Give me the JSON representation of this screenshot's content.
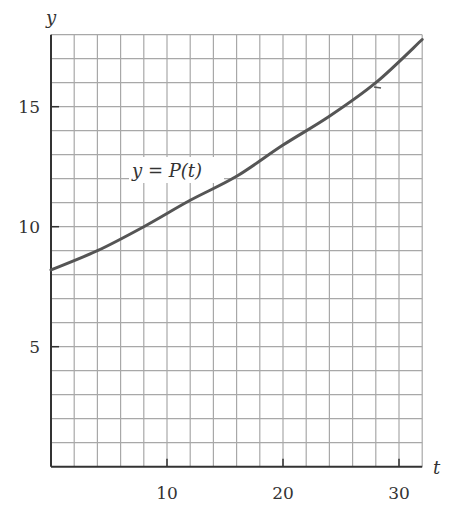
{
  "chart_data": {
    "type": "line",
    "title": "",
    "xlabel": "t",
    "ylabel": "y",
    "xlim": [
      0,
      32
    ],
    "ylim": [
      0,
      18
    ],
    "grid": true,
    "grid_spacing": {
      "x": 2,
      "y": 1
    },
    "x_ticks": [
      10,
      20,
      30
    ],
    "x_tick_labels": [
      "10",
      "20",
      "30"
    ],
    "y_ticks": [
      5,
      10,
      15
    ],
    "y_tick_labels": [
      "5",
      "10",
      "15"
    ],
    "legend": null,
    "annotations": [
      {
        "text": "y = P(t)",
        "t": 7.2,
        "y": 12.1
      }
    ],
    "series": [
      {
        "name": "y = P(t)",
        "x": [
          0,
          4,
          8,
          12,
          16,
          20,
          24,
          28,
          32
        ],
        "values": [
          8.2,
          9.0,
          10.0,
          11.1,
          12.1,
          13.4,
          14.6,
          16.0,
          17.8
        ]
      }
    ]
  },
  "labels": {
    "x_axis": "t",
    "y_axis": "y",
    "curve": "y = P(t)"
  },
  "colors": {
    "grid": "#a8a8a8",
    "axis": "#333333",
    "curve": "#555555",
    "text": "#333333"
  }
}
